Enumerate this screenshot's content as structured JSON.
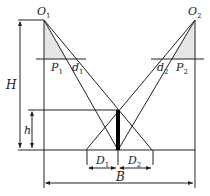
{
  "diagram": {
    "type": "geometry",
    "points": {
      "O1": {
        "label": "O",
        "sub": "1"
      },
      "O2": {
        "label": "O",
        "sub": "2"
      },
      "P1": {
        "label": "P",
        "sub": "1"
      },
      "P2": {
        "label": "P",
        "sub": "2"
      },
      "d1": {
        "label": "d",
        "sub": "1"
      },
      "d2": {
        "label": "d",
        "sub": "2"
      }
    },
    "dimensions": {
      "H": {
        "label": "H"
      },
      "h": {
        "label": "h"
      },
      "D1": {
        "label": "D",
        "sub": "1"
      },
      "D2": {
        "label": "D",
        "sub": "2"
      },
      "B": {
        "label": "B"
      }
    },
    "colors": {
      "line": "#222222",
      "shade": "#e6e6e6",
      "bar": "#000000"
    }
  }
}
